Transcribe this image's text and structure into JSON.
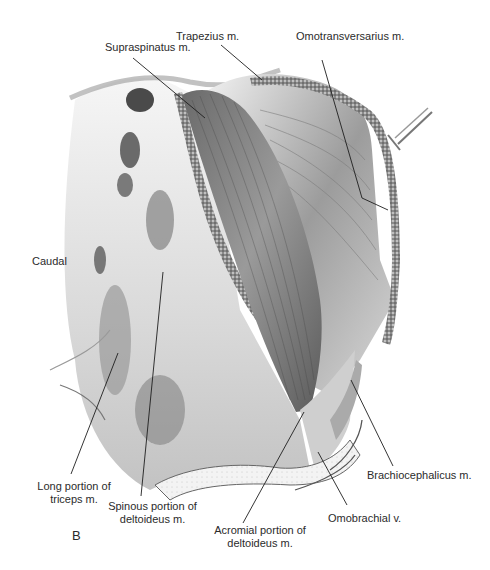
{
  "figure": {
    "panel_letter": "B",
    "orientation_label": "Caudal",
    "labels": [
      {
        "id": "supraspinatus",
        "text": "Supraspinatus m."
      },
      {
        "id": "trapezius",
        "text": "Trapezius m."
      },
      {
        "id": "omotransversarius",
        "text": "Omotransversarius m."
      },
      {
        "id": "long_triceps_line1",
        "text": "Long portion of"
      },
      {
        "id": "long_triceps_line2",
        "text": "triceps  m."
      },
      {
        "id": "spinous_deltoid_line1",
        "text": "Spinous portion of"
      },
      {
        "id": "spinous_deltoid_line2",
        "text": "deltoideus m."
      },
      {
        "id": "acromial_deltoid_line1",
        "text": "Acromial portion of"
      },
      {
        "id": "acromial_deltoid_line2",
        "text": "deltoideus m."
      },
      {
        "id": "brachiocephalicus",
        "text": "Brachiocephalicus m."
      },
      {
        "id": "omobrachial",
        "text": "Omobrachial v."
      }
    ],
    "colors": {
      "ink": "#2b2b2b",
      "muscle_dark": "#5a5a5a",
      "muscle_mid": "#8c8c8c",
      "fascia_light": "#e6e6e6",
      "fat_stipple": "#6e6e6e"
    }
  }
}
